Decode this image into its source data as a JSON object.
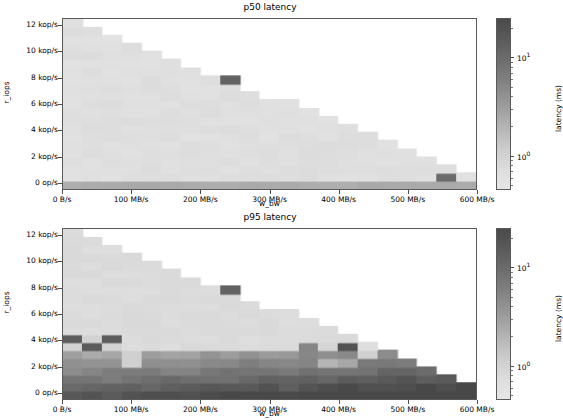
{
  "figure": {
    "width": 560,
    "height": 420,
    "background": "#ffffff"
  },
  "panels": [
    {
      "id": "p50",
      "title": "p50 latency",
      "xlabel": "w_bw",
      "ylabel": "r_iops"
    },
    {
      "id": "p95",
      "title": "p95 latency",
      "xlabel": "w_bw",
      "ylabel": "r_iops"
    }
  ],
  "axis": {
    "yticklabels": [
      "12 kop/s",
      "10 kop/s",
      "8 kop/s",
      "6 kop/s",
      "4 kop/s",
      "2 kop/s",
      "0 op/s"
    ],
    "ytickvalues": [
      12000,
      10000,
      8000,
      6000,
      4000,
      2000,
      0
    ],
    "xticklabels": [
      "0 B/s",
      "100 MB/s",
      "200 MB/s",
      "300 MB/s",
      "400 MB/s",
      "500 MB/s",
      "600 MB/s"
    ],
    "xtickvalues": [
      0,
      100,
      200,
      300,
      400,
      500,
      600
    ],
    "xlim": [
      0,
      600
    ],
    "ylim": [
      -500,
      12500
    ]
  },
  "colorbar": {
    "label": "latency (ms)",
    "ticklabels": [
      "10",
      "10"
    ],
    "tickexponents": [
      "1",
      "0"
    ],
    "scale": "log",
    "vmin": 0.45,
    "vmax": 25,
    "cmap": "Greys",
    "top_color": "#4a4a4a",
    "bottom_color": "#e6e6e6"
  },
  "chart_data": {
    "type": "heatmap",
    "xlabel": "w_bw",
    "ylabel": "r_iops",
    "colorbar_label": "latency (ms)",
    "colorbar_scale": "log",
    "xlim": [
      0,
      600
    ],
    "ylim": [
      -500,
      12500
    ],
    "grid": false,
    "legend": "colorbar-right",
    "x_categories_mb_s": [
      0,
      28.6,
      57.1,
      85.7,
      114.3,
      142.9,
      171.4,
      200,
      228.6,
      257.1,
      285.7,
      314.3,
      342.9,
      371.4,
      400,
      428.6,
      457.1,
      485.7,
      514.3,
      542.9,
      571.4
    ],
    "y_categories_kop_s": [
      0,
      0.6,
      1.2,
      1.8,
      2.4,
      3.0,
      3.6,
      4.2,
      4.8,
      5.4,
      6.0,
      6.6,
      7.2,
      7.8,
      8.4,
      9.0,
      9.6,
      10.2,
      10.8,
      11.4,
      12.0
    ],
    "panels": [
      {
        "name": "p50 latency",
        "note": "Feasible region is a descending staircase: max achievable r_iops falls linearly as w_bw rises. Inside the region latency is uniformly low (~0.55 ms, light gray). The bottom row (0 op/s) is elevated (~2 ms, mid gray) across all w_bw. One anomalous dark cell (~12 ms) at w_bw=228.6 MB/s, r_iops=7.8 kop/s. A dark cell (~10 ms) at w_bw=542.9 MB/s, r_iops=0.6 kop/s. Cells outside the feasible staircase are blank (white).",
        "staircase_max_row_index_per_column": [
          20,
          19,
          18,
          17,
          16,
          15,
          14,
          13,
          12,
          11,
          10,
          10,
          9,
          8,
          7,
          6,
          5,
          4,
          3,
          2,
          1
        ],
        "interior_latency_ms": 0.55,
        "bottom_row_latency_ms": 2.0,
        "anomalies": [
          {
            "x_mb_s": 228.6,
            "y_kop_s": 7.8,
            "latency_ms": 12.0
          },
          {
            "x_mb_s": 542.9,
            "y_kop_s": 0.6,
            "latency_ms": 10.0
          }
        ]
      },
      {
        "name": "p95 latency",
        "note": "Same feasible staircase envelope as p50. Upper portion of the region is low latency (~0.6 ms, light gray). Rows at or below ~3 kop/s are strongly elevated (2-20 ms, mid-to-dark gray) and grow darker toward higher w_bw and lower r_iops. Scattered dark cells (~12-20 ms) appear near 4.2 kop/s at low w_bw and near 3.6-4.2 kop/s around 342-400 MB/s.",
        "staircase_max_row_index_per_column": [
          20,
          19,
          18,
          17,
          16,
          15,
          14,
          13,
          12,
          11,
          10,
          10,
          9,
          8,
          7,
          6,
          5,
          4,
          3,
          2,
          1
        ],
        "upper_latency_ms": 0.6,
        "lower_band_latency_ms_range": [
          2.0,
          20.0
        ],
        "anomalies": [
          {
            "x_mb_s": 0,
            "y_kop_s": 4.2,
            "latency_ms": 15.0
          },
          {
            "x_mb_s": 28.6,
            "y_kop_s": 3.9,
            "latency_ms": 15.0
          },
          {
            "x_mb_s": 57.1,
            "y_kop_s": 4.2,
            "latency_ms": 15.0
          },
          {
            "x_mb_s": 342.9,
            "y_kop_s": 3.6,
            "latency_ms": 8.0
          },
          {
            "x_mb_s": 400,
            "y_kop_s": 3.6,
            "latency_ms": 18.0
          }
        ]
      }
    ]
  }
}
